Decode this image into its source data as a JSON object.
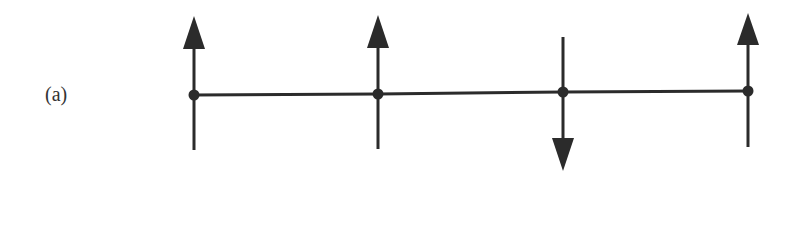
{
  "figure": {
    "panel_label": "(a)",
    "stroke_color": "#2b2b2b"
  },
  "timeline": {
    "x_start": 194,
    "x_end": 748,
    "nodes": [
      {
        "index": 0,
        "x": 194,
        "y": 95,
        "arrow": "up",
        "arrow_tip_y": 16,
        "arrow_base_y": 49,
        "tail_y": 150
      },
      {
        "index": 1,
        "x": 378,
        "y": 94,
        "arrow": "up",
        "arrow_tip_y": 15,
        "arrow_base_y": 48,
        "tail_y": 149
      },
      {
        "index": 2,
        "x": 563,
        "y": 92,
        "arrow": "down",
        "arrow_tip_y": 171,
        "arrow_base_y": 138,
        "tail_y": 37
      },
      {
        "index": 3,
        "x": 748,
        "y": 91,
        "arrow": "up",
        "arrow_tip_y": 13,
        "arrow_base_y": 45,
        "tail_y": 147
      }
    ]
  }
}
